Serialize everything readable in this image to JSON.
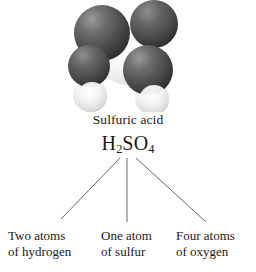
{
  "figure": {
    "background_color": "#ffffff",
    "text_color": "#1a1a1a",
    "line_color": "#5a5a5a"
  },
  "molecule": {
    "name": "sulfuric-acid-space-filling-model",
    "description": "Space-filling molecular model of sulfuric acid",
    "atom_colors": {
      "oxygen": "#4a4a4a",
      "sulfur": "#f2f2f0",
      "hydrogen": "#eaeae8"
    },
    "atoms": [
      {
        "element": "O",
        "label": "oxygen-top-left",
        "cx": 103,
        "cy": 33,
        "r": 27,
        "shade": "dark"
      },
      {
        "element": "O",
        "label": "oxygen-top-right",
        "cx": 152,
        "cy": 24,
        "r": 23,
        "shade": "dark"
      },
      {
        "element": "S",
        "label": "sulfur-center",
        "cx": 128,
        "cy": 55,
        "r": 29,
        "shade": "light"
      },
      {
        "element": "O",
        "label": "oxygen-lower-left",
        "cx": 90,
        "cy": 66,
        "r": 21,
        "shade": "dark"
      },
      {
        "element": "O",
        "label": "oxygen-lower-right",
        "cx": 147,
        "cy": 70,
        "r": 24,
        "shade": "dark"
      },
      {
        "element": "H",
        "label": "hydrogen-left",
        "cx": 90,
        "cy": 94,
        "r": 16,
        "shade": "white"
      },
      {
        "element": "H",
        "label": "hydrogen-right",
        "cx": 152,
        "cy": 97,
        "r": 16,
        "shade": "white"
      }
    ]
  },
  "labels": {
    "compound_name": "Sulfuric acid",
    "formula": {
      "parts": [
        {
          "text": "H",
          "sub": false
        },
        {
          "text": "2",
          "sub": true
        },
        {
          "text": "SO",
          "sub": false
        },
        {
          "text": "4",
          "sub": true
        }
      ],
      "plain": "H2SO4"
    }
  },
  "leaders": [
    {
      "name": "leader-hydrogen",
      "x1": 120,
      "y1": 158,
      "x2": 61,
      "y2": 219
    },
    {
      "name": "leader-sulfur",
      "x1": 127,
      "y1": 158,
      "x2": 127,
      "y2": 222
    },
    {
      "name": "leader-oxygen",
      "x1": 136,
      "y1": 158,
      "x2": 206,
      "y2": 222
    }
  ],
  "callouts": [
    {
      "name": "callout-hydrogen",
      "element": "hydrogen",
      "count": "Two",
      "line1": "Two atoms",
      "line2": "of hydrogen"
    },
    {
      "name": "callout-sulfur",
      "element": "sulfur",
      "count": "One",
      "line1": "One atom",
      "line2": "of sulfur"
    },
    {
      "name": "callout-oxygen",
      "element": "oxygen",
      "count": "Four",
      "line1": "Four atoms",
      "line2": "of oxygen"
    }
  ]
}
